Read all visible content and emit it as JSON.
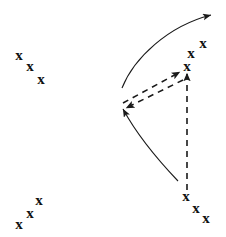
{
  "figure": {
    "name": "motion-vector-diagram",
    "background_color": "#ffffff",
    "stroke_color": "#1a1a1a",
    "marker_color": "#111111",
    "width": 226,
    "height": 237
  },
  "marker_glyph": "x",
  "clusters": [
    {
      "name": "top-left-cluster",
      "label": "x",
      "points": [
        {
          "x": 19,
          "y": 55
        },
        {
          "x": 30,
          "y": 66
        },
        {
          "x": 41,
          "y": 79
        }
      ]
    },
    {
      "name": "bottom-left-cluster",
      "label": "x",
      "points": [
        {
          "x": 19,
          "y": 224
        },
        {
          "x": 30,
          "y": 213
        },
        {
          "x": 39,
          "y": 200
        }
      ]
    },
    {
      "name": "top-right-cluster",
      "label": "x",
      "points": [
        {
          "x": 187,
          "y": 66
        },
        {
          "x": 191,
          "y": 53
        },
        {
          "x": 203,
          "y": 43
        }
      ]
    },
    {
      "name": "bottom-right-cluster",
      "label": "x",
      "points": [
        {
          "x": 186,
          "y": 196
        },
        {
          "x": 196,
          "y": 208
        },
        {
          "x": 206,
          "y": 218
        }
      ]
    }
  ],
  "solid_curves": [
    {
      "name": "upper-solid-curve-arrow",
      "path": "M 122,88 C 134,58 168,26 211,15",
      "arrow": "right",
      "dashed": false
    },
    {
      "name": "lower-solid-curve-arrow",
      "path": "M 178,181 C 158,160 136,133 123,109",
      "arrow": "left-down",
      "dashed": false
    }
  ],
  "dashed_arrows": [
    {
      "name": "dashed-arrow-up-right",
      "from": {
        "x": 123,
        "y": 103
      },
      "to": {
        "x": 180,
        "y": 72
      },
      "dashed": true
    },
    {
      "name": "dashed-arrow-down-left",
      "from": {
        "x": 183,
        "y": 80
      },
      "to": {
        "x": 126,
        "y": 108
      },
      "dashed": true
    },
    {
      "name": "dashed-arrow-vertical-up",
      "from": {
        "x": 187,
        "y": 190
      },
      "to": {
        "x": 187,
        "y": 73
      },
      "dashed": true
    }
  ],
  "stroke_widths": {
    "solid": 1.1,
    "dashed": 1.6
  },
  "dash_pattern": "6 5"
}
